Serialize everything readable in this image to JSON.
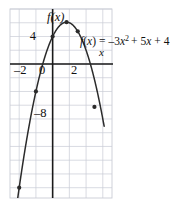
{
  "figure": {
    "name": "parabola-graph",
    "background_color": "#ffffff",
    "grid_color": "#c9ccd6",
    "axis_color": "#1a1a1a",
    "curve_color": "#2b2b2b",
    "point_color": "#2b2b2b",
    "frame": {
      "x": 10,
      "y": 9,
      "width": 102,
      "height": 189
    }
  },
  "labels": {
    "function_name": "f(x)",
    "equation": "f(x) = –3x² + 5x + 4",
    "equation_parts": {
      "fname": "f",
      "arg": "(x)",
      "equals": "=",
      "a_term": "–3x",
      "exponent": "2",
      "b_term": "+ 5x",
      "c_term": "+ 4"
    },
    "x_axis_label": "x",
    "x_ticks": [
      "–2",
      "0",
      "2"
    ],
    "y_ticks": [
      "4",
      "–8"
    ]
  },
  "chart_data": {
    "type": "line",
    "title": "",
    "subtitle": "",
    "xlabel": "x",
    "ylabel": "f(x)",
    "legend": [
      "f(x) = –3x² + 5x + 4"
    ],
    "legend_position": "inside-right",
    "grid": true,
    "equation": "f(x) = -3x^2 + 5x + 4",
    "coefficients": {
      "a": -3,
      "b": 5,
      "c": 4
    },
    "vertex": [
      0.833,
      6.083
    ],
    "roots": [
      -0.758,
      2.091
    ],
    "y_intercept": 4,
    "xlim": [
      -2.55,
      3.55
    ],
    "ylim": [
      -19.5,
      8.0
    ],
    "x_tick_values": [
      -2,
      0,
      2
    ],
    "y_tick_values": [
      4,
      -8
    ],
    "grid_x_step": 1,
    "grid_y_step": 2,
    "marked_points": [
      {
        "x": 0,
        "y": 4
      },
      {
        "x": 0.833,
        "y": 6.083
      },
      {
        "x": 1.5,
        "y": 4.75
      },
      {
        "x": -1,
        "y": -4
      },
      {
        "x": 2.5,
        "y": -6.25
      },
      {
        "x": -2,
        "y": -18
      }
    ],
    "curve_x_range": [
      -2.13,
      3.08
    ]
  }
}
